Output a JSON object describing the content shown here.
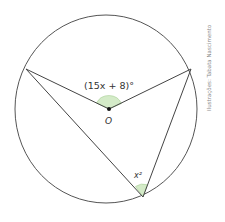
{
  "diagram": {
    "type": "inscribed-and-central-angle",
    "circle": {
      "cx": 106,
      "cy": 109,
      "rx": 91,
      "ry": 94
    },
    "points": {
      "A": {
        "x": 26,
        "y": 69
      },
      "B": {
        "x": 191,
        "y": 69
      },
      "O": {
        "x": 109,
        "y": 109
      },
      "C": {
        "x": 143,
        "y": 197
      }
    },
    "central_angle_label": "(15x + 8)°",
    "center_label": "O",
    "inscribed_angle_label": "x²",
    "credit": "Ilustrações: Tabata Nascimento",
    "colors": {
      "stroke": "#444444",
      "angle_fill": "#d4ebc8",
      "angle_stroke": "#8fbf7a"
    }
  }
}
